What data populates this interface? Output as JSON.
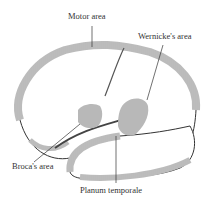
{
  "figure": {
    "labels": {
      "motor": "Motor area",
      "wernicke": "Wernicke's area",
      "broca": "Broca's area",
      "planum": "Planum temporale"
    },
    "colors": {
      "outline": "#3a3a3a",
      "highlight": "#b8b8b8",
      "text": "#333333"
    }
  }
}
